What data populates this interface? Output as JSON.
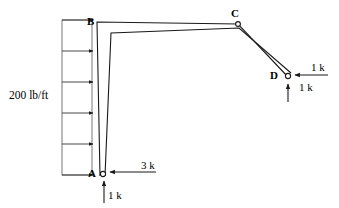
{
  "diagram": {
    "type": "structural-frame-deflection",
    "title": "",
    "background_color": "#ffffff",
    "line_color": "#1a1a1a",
    "canvas": {
      "width": 339,
      "height": 208
    },
    "distributed_load": {
      "label": "200 lb/ft",
      "direction": "right",
      "arrow_count": 6,
      "box": {
        "x": 62,
        "y": 20,
        "width": 30,
        "height": 155
      },
      "arrow_y_positions": [
        20,
        51,
        82,
        113,
        144,
        175
      ]
    },
    "nodes": [
      {
        "id": "A",
        "label": "A",
        "x": 103,
        "y": 174,
        "marker": "pin-circle"
      },
      {
        "id": "B",
        "label": "B",
        "x": 97,
        "y": 22,
        "marker": "corner"
      },
      {
        "id": "C",
        "label": "C",
        "x": 238,
        "y": 22,
        "marker": "pin-circle"
      },
      {
        "id": "D",
        "label": "D",
        "x": 287,
        "y": 76,
        "marker": "pin-circle"
      }
    ],
    "members": [
      {
        "id": "AB",
        "from": "A",
        "to": "B",
        "style": "double-line"
      },
      {
        "id": "BC",
        "from": "B",
        "to": "C",
        "style": "double-line"
      },
      {
        "id": "CD",
        "from": "C",
        "to": "D",
        "style": "double-line"
      }
    ],
    "forces": [
      {
        "id": "force-a-horizontal",
        "label": "3 k",
        "at_node": "A",
        "direction": "left",
        "tail_x": 156,
        "head_x": 110,
        "y": 172
      },
      {
        "id": "force-a-vertical",
        "label": "1 k",
        "at_node": "A",
        "direction": "up",
        "x": 104,
        "tail_y": 202,
        "head_y": 181
      },
      {
        "id": "force-d-horizontal",
        "label": "1 k",
        "at_node": "D",
        "direction": "left",
        "tail_x": 327,
        "head_x": 294,
        "y": 75
      },
      {
        "id": "force-d-vertical",
        "label": "1 k",
        "at_node": "D",
        "direction": "up",
        "x": 288,
        "tail_y": 101,
        "head_y": 83
      }
    ]
  }
}
